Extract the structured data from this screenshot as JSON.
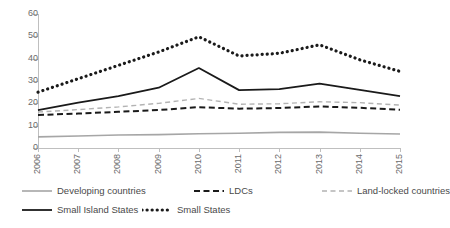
{
  "chart_data": {
    "type": "line",
    "title": "",
    "subtitle": "",
    "xlabel": "",
    "ylabel": "",
    "x": [
      "2006",
      "2007",
      "2008",
      "2009",
      "2010",
      "2011",
      "2012",
      "2013",
      "2014",
      "2015"
    ],
    "categories": [
      "2006",
      "2007",
      "2008",
      "2009",
      "2010",
      "2011",
      "2012",
      "2013",
      "2014",
      "2015"
    ],
    "xlim": [
      2006,
      2015
    ],
    "ylim": [
      0,
      60
    ],
    "yticks": [
      0,
      10,
      20,
      30,
      40,
      50,
      60
    ],
    "ytick_labels": [
      "0",
      "10",
      "20",
      "30",
      "40",
      "50",
      "60"
    ],
    "grid": false,
    "legend_position": "bottom",
    "series": [
      {
        "name": "Developing countries",
        "style": "solid",
        "color": "#a6a6a6",
        "width": 1.6,
        "values": [
          5.0,
          5.4,
          5.8,
          6.0,
          6.4,
          6.6,
          7.0,
          7.1,
          6.6,
          6.3
        ]
      },
      {
        "name": "LDCs",
        "style": "dashed",
        "color": "#1a1a1a",
        "width": 2.0,
        "values": [
          14.8,
          15.4,
          16.2,
          17.0,
          18.3,
          17.6,
          17.9,
          18.6,
          18.0,
          17.1
        ]
      },
      {
        "name": "Land-locked countries",
        "style": "dashed",
        "color": "#b3b3b3",
        "width": 1.4,
        "values": [
          16.1,
          17.2,
          18.4,
          20.0,
          22.2,
          19.6,
          19.8,
          20.7,
          20.3,
          19.2
        ]
      },
      {
        "name": "Small Island States",
        "style": "solid",
        "color": "#1a1a1a",
        "width": 1.8,
        "values": [
          17.0,
          20.3,
          23.2,
          27.0,
          35.8,
          25.9,
          26.4,
          28.8,
          26.0,
          23.2
        ]
      },
      {
        "name": "Small States",
        "style": "dotted",
        "color": "#1a1a1a",
        "width": 3.2,
        "values": [
          25.0,
          31.0,
          37.0,
          43.0,
          49.8,
          41.2,
          42.4,
          46.2,
          39.5,
          34.3
        ]
      }
    ],
    "legend": [
      {
        "label": "Developing countries",
        "style": "solid",
        "color": "#a6a6a6"
      },
      {
        "label": "LDCs",
        "style": "dashed",
        "color": "#1a1a1a"
      },
      {
        "label": "Land-locked countries",
        "style": "dashed",
        "color": "#b3b3b3"
      },
      {
        "label": "Small Island States",
        "style": "solid",
        "color": "#1a1a1a"
      },
      {
        "label": "Small States",
        "style": "dotted",
        "color": "#1a1a1a"
      }
    ]
  },
  "axes": {
    "y_labels": [
      "60",
      "50",
      "40",
      "30",
      "20",
      "10",
      "0"
    ],
    "x_labels": [
      "2006",
      "2007",
      "2008",
      "2009",
      "2010",
      "2011",
      "2012",
      "2013",
      "2014",
      "2015"
    ]
  }
}
